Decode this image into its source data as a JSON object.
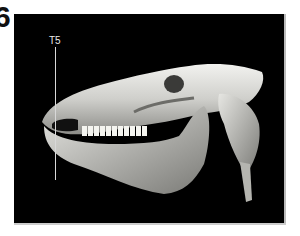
{
  "figure": {
    "panel_label": "6",
    "image_description": "3D CT volume rendering of a horse skull, lateral view",
    "marker": {
      "label": "T5"
    },
    "colors": {
      "background": "#000000",
      "bone": "#d9d9d6",
      "marker": "#d8d8d8"
    }
  }
}
